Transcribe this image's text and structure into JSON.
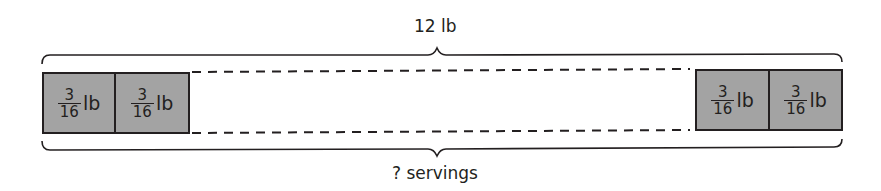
{
  "diagram": {
    "type": "tape-diagram",
    "total_label": "12 lb",
    "count_label": "? servings",
    "segments": [
      {
        "numerator": "3",
        "denominator": "16",
        "unit": "lb",
        "position": "left-1"
      },
      {
        "numerator": "3",
        "denominator": "16",
        "unit": "lb",
        "position": "left-2"
      },
      {
        "numerator": "3",
        "denominator": "16",
        "unit": "lb",
        "position": "right-1"
      },
      {
        "numerator": "3",
        "denominator": "16",
        "unit": "lb",
        "position": "right-2"
      }
    ],
    "gap_style": "dashed",
    "colors": {
      "segment_fill": "#a3a3a3",
      "stroke": "#231f20",
      "background": "#ffffff"
    }
  }
}
